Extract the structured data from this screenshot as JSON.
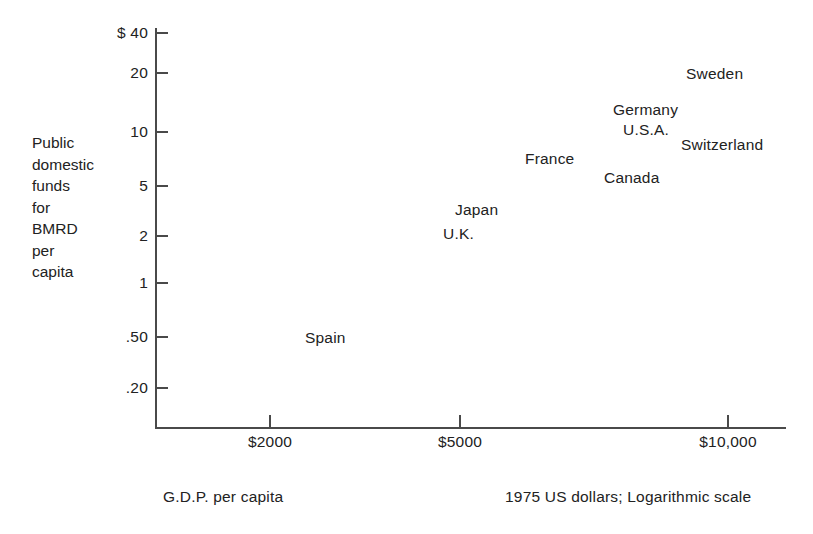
{
  "figure": {
    "width": 813,
    "height": 534,
    "background": "#ffffff",
    "axis_color": "#4a4a4a",
    "text_color": "#222222"
  },
  "y_axis": {
    "title_lines": [
      "Public",
      "domestic",
      "funds",
      "for",
      "BMRD",
      "per",
      "capita"
    ],
    "title_text": "Public domestic funds for BMRD per capita",
    "ticks": [
      {
        "label": "$ 40",
        "value": 40,
        "y": 33
      },
      {
        "label": "20",
        "value": 20,
        "y": 73
      },
      {
        "label": "10",
        "value": 10,
        "y": 132
      },
      {
        "label": "5",
        "value": 5,
        "y": 186
      },
      {
        "label": "2",
        "value": 2,
        "y": 236
      },
      {
        "label": "1",
        "value": 1,
        "y": 283
      },
      {
        "label": ".50",
        "value": 0.5,
        "y": 337
      },
      {
        "label": ".20",
        "value": 0.2,
        "y": 388
      }
    ]
  },
  "x_axis": {
    "caption": "G.D.P. per capita",
    "ticks": [
      {
        "label": "$2000",
        "value": 2000,
        "x": 270
      },
      {
        "label": "$5000",
        "value": 5000,
        "x": 460
      },
      {
        "label": "$10,000",
        "value": 10000,
        "x": 728
      }
    ]
  },
  "note": "1975 US dollars; Logarithmic scale",
  "labels": [
    {
      "name": "sweden",
      "text": "Sweden",
      "x": 686,
      "y": 65
    },
    {
      "name": "germany",
      "text": "Germany",
      "x": 613,
      "y": 101
    },
    {
      "name": "usa",
      "text": "U.S.A.",
      "x": 623,
      "y": 121
    },
    {
      "name": "switzerland",
      "text": "Switzerland",
      "x": 681,
      "y": 136
    },
    {
      "name": "france",
      "text": "France",
      "x": 525,
      "y": 150
    },
    {
      "name": "canada",
      "text": "Canada",
      "x": 604,
      "y": 169
    },
    {
      "name": "japan",
      "text": "Japan",
      "x": 455,
      "y": 201
    },
    {
      "name": "uk",
      "text": "U.K.",
      "x": 443,
      "y": 225
    },
    {
      "name": "spain",
      "text": "Spain",
      "x": 305,
      "y": 329
    }
  ],
  "chart_data": {
    "type": "scatter",
    "title": "",
    "xlabel": "G.D.P. per capita",
    "ylabel": "Public domestic funds for BMRD per capita",
    "note": "1975 US dollars; Logarithmic scale",
    "xscale": "log",
    "yscale": "log",
    "grid": false,
    "legend": "none",
    "marker_style": "text-label-only",
    "xlim": [
      1400,
      12500
    ],
    "ylim": [
      0.15,
      48
    ],
    "xticks": [
      2000,
      5000,
      10000
    ],
    "xticklabels": [
      "$2000",
      "$5000",
      "$10,000"
    ],
    "yticks": [
      0.2,
      0.5,
      1,
      2,
      5,
      10,
      20,
      40
    ],
    "yticklabels": [
      ".20",
      ".50",
      "1",
      "2",
      "5",
      "10",
      "20",
      "$ 40"
    ],
    "points": [
      {
        "label": "Sweden",
        "x": 8800,
        "y": 24.0
      },
      {
        "label": "Germany",
        "x": 7200,
        "y": 14.0
      },
      {
        "label": "U.S.A.",
        "x": 7600,
        "y": 11.0
      },
      {
        "label": "Switzerland",
        "x": 9800,
        "y": 8.5
      },
      {
        "label": "France",
        "x": 5800,
        "y": 6.5
      },
      {
        "label": "Canada",
        "x": 7100,
        "y": 5.0
      },
      {
        "label": "Japan",
        "x": 4700,
        "y": 2.8
      },
      {
        "label": "U.K.",
        "x": 4400,
        "y": 2.1
      },
      {
        "label": "Spain",
        "x": 2700,
        "y": 0.52
      }
    ]
  }
}
